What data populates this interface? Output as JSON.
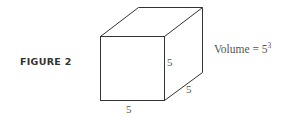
{
  "figure": {
    "label": "FIGURE 2",
    "shape": "cube",
    "edges": {
      "front_right": "5",
      "depth": "5",
      "bottom": "5"
    },
    "volume": {
      "text": "Volume = 5",
      "exponent": "3"
    },
    "colors": {
      "line": "#333333",
      "text": "#555555"
    }
  }
}
